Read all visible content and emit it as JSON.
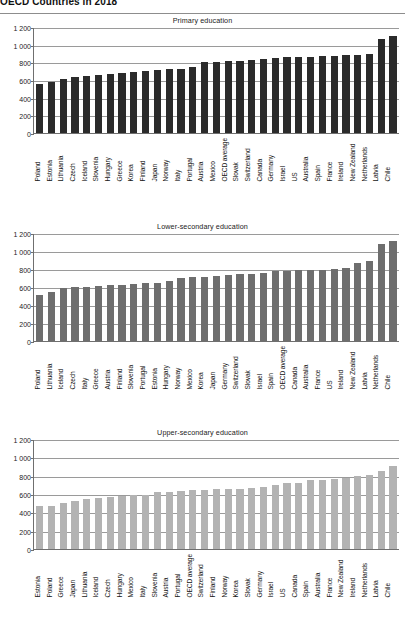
{
  "page": {
    "title": "OECD Countries in 2018"
  },
  "chart_data": [
    {
      "type": "bar",
      "title": "Primary education",
      "xlabel": "",
      "ylabel": "",
      "ylim": [
        0,
        1200
      ],
      "yticks": [
        "0",
        "200",
        "400",
        "600",
        "800",
        "1 000",
        "1 200"
      ],
      "grid": true,
      "legend": "none",
      "bar_color": "#2b2b2b",
      "categories": [
        "Poland",
        "Estonia",
        "Lithuania",
        "Czech",
        "Iceland",
        "Slovenia",
        "Hungary",
        "Greece",
        "Korea",
        "Finland",
        "Japan",
        "Norway",
        "Italy",
        "Portugal",
        "Austria",
        "Mexico",
        "OECD average",
        "Slovak",
        "Switzerland",
        "Canada",
        "Germany",
        "Israel",
        "US",
        "Australia",
        "Spain",
        "France",
        "Ireland",
        "New Zealand",
        "Netherlands",
        "Latvia",
        "Chile"
      ],
      "values": [
        560,
        580,
        610,
        630,
        650,
        660,
        670,
        680,
        690,
        700,
        710,
        720,
        725,
        745,
        800,
        805,
        815,
        820,
        830,
        840,
        845,
        855,
        860,
        865,
        870,
        875,
        880,
        885,
        890,
        1060,
        1100
      ]
    },
    {
      "type": "bar",
      "title": "Lower-secondary education",
      "xlabel": "",
      "ylabel": "",
      "ylim": [
        0,
        1200
      ],
      "yticks": [
        "0",
        "200",
        "400",
        "600",
        "800",
        "1 000",
        "1 200"
      ],
      "grid": true,
      "legend": "none",
      "bar_color": "#6e6e6e",
      "categories": [
        "Poland",
        "Lithuania",
        "Iceland",
        "Czech",
        "Italy",
        "Greece",
        "Austria",
        "Finland",
        "Slovenia",
        "Portugal",
        "Estonia",
        "Hungary",
        "Norway",
        "Mexico",
        "Korea",
        "Japan",
        "Germany",
        "Switzerland",
        "Slovak",
        "Israel",
        "Spain",
        "OECD average",
        "Canada",
        "Australia",
        "France",
        "US",
        "Ireland",
        "New Zealand",
        "Latvia",
        "Netherlands",
        "Chile"
      ],
      "values": [
        510,
        545,
        590,
        600,
        605,
        610,
        620,
        625,
        630,
        640,
        645,
        670,
        700,
        710,
        715,
        720,
        730,
        745,
        750,
        760,
        775,
        780,
        785,
        790,
        790,
        795,
        810,
        870,
        890,
        1075,
        1115
      ]
    },
    {
      "type": "bar",
      "title": "Upper-secondary education",
      "xlabel": "",
      "ylabel": "",
      "ylim": [
        0,
        1200
      ],
      "yticks": [
        "0",
        "200",
        "400",
        "600",
        "800",
        "1 000",
        "1 200"
      ],
      "grid": true,
      "legend": "none",
      "bar_color": "#b3b3b3",
      "categories": [
        "Estonia",
        "Poland",
        "Greece",
        "Japan",
        "Lithuania",
        "Iceland",
        "Czech",
        "Hungary",
        "Mexico",
        "Italy",
        "Slovenia",
        "Austria",
        "Portugal",
        "OECD average",
        "Switzerland",
        "Finland",
        "Norway",
        "Korea",
        "Slovak",
        "Germany",
        "Israel",
        "US",
        "Canada",
        "Spain",
        "Australia",
        "France",
        "New Zealand",
        "Ireland",
        "Netherlands",
        "Latvia",
        "Chile"
      ],
      "values": [
        470,
        465,
        500,
        525,
        550,
        555,
        570,
        580,
        585,
        590,
        620,
        625,
        630,
        640,
        645,
        650,
        655,
        660,
        665,
        675,
        695,
        715,
        725,
        750,
        755,
        765,
        780,
        795,
        805,
        850,
        905
      ]
    }
  ],
  "chart_extra": {
    "note": "values appended for last bars of chart 3",
    "chart3_tail": [
      1065,
      1115
    ]
  }
}
